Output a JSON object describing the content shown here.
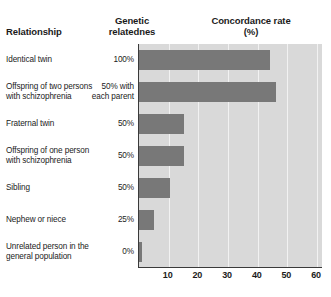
{
  "headers": {
    "relationship": "Relationship",
    "relatedness_line1": "Genetic",
    "relatedness_line2": "relatednes",
    "concordance_line1": "Concordance rate",
    "concordance_line2": "(%)"
  },
  "chart_data": {
    "type": "bar",
    "orientation": "horizontal",
    "title": "Concordance rate (%)",
    "xlabel": "",
    "ylabel": "Relationship",
    "xlim": [
      0,
      62
    ],
    "grid": true,
    "legend": "none",
    "xticks": [
      10,
      20,
      30,
      40,
      50,
      60
    ],
    "xtick_labels": [
      "10",
      "20",
      "30",
      "40",
      "50",
      "60"
    ],
    "categories": [
      "Identical twin",
      "Offspring of two persons with schizophrenia",
      "Fraternal twin",
      "Offspring of one person with schizophrenia",
      "Sibling",
      "Nephew or niece",
      "Unrelated person in the general population"
    ],
    "values": [
      44,
      46,
      15,
      15,
      10.5,
      5,
      1
    ],
    "series": [
      {
        "name": "Concordance rate (%)",
        "values": [
          44,
          46,
          15,
          15,
          10.5,
          5,
          1
        ],
        "color": "#787878"
      }
    ],
    "genetic_relatedness": [
      "100%",
      "50% with each parent",
      "50%",
      "50%",
      "50%",
      "25%",
      "0%"
    ]
  },
  "rows": [
    {
      "label_line1": "Identical twin",
      "label_line2": "",
      "value_line1": "100%",
      "value_line2": "",
      "bar": 44
    },
    {
      "label_line1": "Offspring of two persons",
      "label_line2": "with schizophrenia",
      "value_line1": "50% with",
      "value_line2": "each parent",
      "bar": 46
    },
    {
      "label_line1": "Fraternal twin",
      "label_line2": "",
      "value_line1": "50%",
      "value_line2": "",
      "bar": 15
    },
    {
      "label_line1": "Offspring of one person",
      "label_line2": "with schizophrenia",
      "value_line1": "50%",
      "value_line2": "",
      "bar": 15
    },
    {
      "label_line1": "Sibling",
      "label_line2": "",
      "value_line1": "50%",
      "value_line2": "",
      "bar": 10.5
    },
    {
      "label_line1": "Nephew or niece",
      "label_line2": "",
      "value_line1": "25%",
      "value_line2": "",
      "bar": 5
    },
    {
      "label_line1": "Unrelated person in the",
      "label_line2": "general population",
      "value_line1": "0%",
      "value_line2": "",
      "bar": 1
    }
  ],
  "colors": {
    "bar": "#787878",
    "plot_background": "#d9d9d9",
    "gridline": "#f2f2f2",
    "axis": "#3a3a3a",
    "text": "#1b1b1b"
  }
}
